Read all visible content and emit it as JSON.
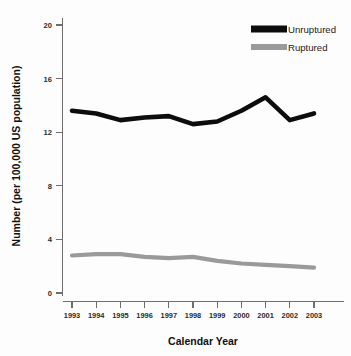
{
  "chart_data": {
    "type": "line",
    "title": "",
    "xlabel": "Calendar Year",
    "ylabel": "Number (per 100,000 US population)",
    "categories": [
      "1993",
      "1994",
      "1995",
      "1996",
      "1997",
      "1998",
      "1999",
      "2000",
      "2001",
      "2002",
      "2003"
    ],
    "x": [
      1993,
      1994,
      1995,
      1996,
      1997,
      1998,
      1999,
      2000,
      2001,
      2002,
      2003
    ],
    "ylim": [
      0,
      20
    ],
    "xlim": [
      1993,
      2003
    ],
    "yticks": [
      0,
      4,
      8,
      12,
      16,
      20
    ],
    "ytick_labels": [
      "0",
      "4",
      "8",
      "12",
      "16",
      "20"
    ],
    "xtick_labels": [
      "1993",
      "1994",
      "1995",
      "1996",
      "1997",
      "1998",
      "1999",
      "2000",
      "2001",
      "2002",
      "2003"
    ],
    "grid": false,
    "legend_position": "top-right",
    "series": [
      {
        "name": "Unruptured",
        "color": "#0d0d0d",
        "line_width": 4.6,
        "values": [
          13.6,
          13.4,
          12.9,
          13.1,
          13.2,
          12.6,
          12.8,
          13.6,
          14.6,
          12.9,
          13.4
        ]
      },
      {
        "name": "Ruptured",
        "color": "#9a9a9a",
        "line_width": 4.2,
        "values": [
          2.8,
          2.9,
          2.9,
          2.7,
          2.6,
          2.7,
          2.4,
          2.2,
          2.1,
          2.0,
          1.9
        ]
      }
    ]
  },
  "legend": {
    "entries": [
      {
        "label": "Unruptured",
        "color": "#0d0d0d"
      },
      {
        "label": "Ruptured",
        "color": "#9a9a9a"
      }
    ]
  },
  "axes": {
    "x_title": "Calendar Year",
    "y_title": "Number (per 100,000 US population)"
  }
}
